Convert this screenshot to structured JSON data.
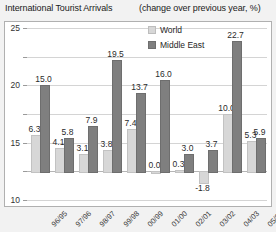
{
  "header": {
    "title": "International Tourist Arrivals",
    "subtitle": "(change over previous year, %)"
  },
  "legend": {
    "world_label": "World",
    "world_color": "#d7d7d7",
    "middle_east_label": "Middle East",
    "middle_east_color": "#7f7f7f"
  },
  "chart_data": {
    "type": "bar",
    "title": "International Tourist Arrivals",
    "subtitle": "(change over previous year, %)",
    "xlabel": "",
    "ylabel": "",
    "ylim": [
      -5,
      25
    ],
    "yticks": [
      -5,
      0,
      5,
      10,
      15,
      20,
      25
    ],
    "ytick_labels": [
      "-5",
      "0",
      "5",
      "10",
      "15",
      "20",
      "25"
    ],
    "grid": true,
    "legend_position": "top-center",
    "categories": [
      "96/95",
      "97/96",
      "98/97",
      "99/98",
      "00/99",
      "01/00",
      "02/01",
      "03/02",
      "04/03",
      "05/04"
    ],
    "series": [
      {
        "name": "World",
        "color": "#d7d7d7",
        "values": [
          6.3,
          4.1,
          3.1,
          3.8,
          7.4,
          0.0,
          0.3,
          -1.8,
          10.0,
          5.3
        ],
        "labels": [
          "6.3",
          "4.1",
          "3.1",
          "3.8",
          "7.4",
          "0.0",
          "0.3",
          "-1.8",
          "10.0",
          "5.3"
        ]
      },
      {
        "name": "Middle East",
        "color": "#7f7f7f",
        "values": [
          15.0,
          5.8,
          7.9,
          19.5,
          13.7,
          16.0,
          3.0,
          3.7,
          22.7,
          5.9
        ],
        "labels": [
          "15.0",
          "5.8",
          "7.9",
          "19.5",
          "13.7",
          "16.0",
          "3.0",
          "3.7",
          "22.7",
          "5.9"
        ]
      }
    ]
  }
}
